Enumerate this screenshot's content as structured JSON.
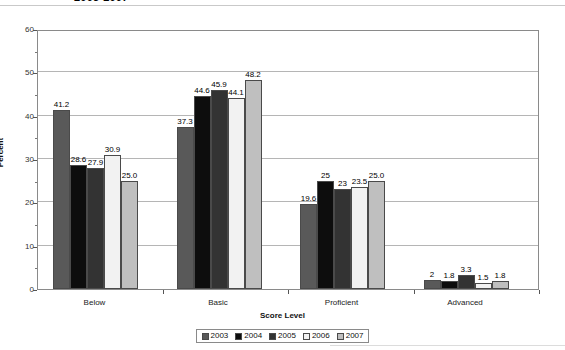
{
  "chart_data": {
    "type": "bar",
    "title": "2003-2007",
    "xlabel": "Score Level",
    "ylabel": "Percent",
    "ylim": [
      0,
      60
    ],
    "ytick_step": 10,
    "yticks": [
      0,
      10,
      20,
      30,
      40,
      50,
      60
    ],
    "grid": true,
    "legend_position": "bottom",
    "categories": [
      "Below",
      "Basic",
      "Proficient",
      "Advanced"
    ],
    "series": [
      {
        "name": "2003",
        "color": "#595959",
        "values": [
          41.2,
          37.3,
          19.6,
          2
        ],
        "labels": [
          "41.2",
          "37.3",
          "19.6",
          "2"
        ]
      },
      {
        "name": "2004",
        "color": "#0d0d0d",
        "values": [
          28.6,
          44.6,
          25,
          1.8
        ],
        "labels": [
          "28.6",
          "44.6",
          "25",
          "1.8"
        ]
      },
      {
        "name": "2005",
        "color": "#333333",
        "values": [
          27.9,
          45.9,
          23,
          3.3
        ],
        "labels": [
          "27.9",
          "45.9",
          "23",
          "3.3"
        ]
      },
      {
        "name": "2006",
        "color": "#f2f2f2",
        "values": [
          30.9,
          44.1,
          23.5,
          1.5
        ],
        "labels": [
          "30.9",
          "44.1",
          "23.5",
          "1.5"
        ]
      },
      {
        "name": "2007",
        "color": "#bfbfbf",
        "values": [
          25.0,
          48.2,
          25.0,
          1.8
        ],
        "labels": [
          "25.0",
          "48.2",
          "25.0",
          "1.8"
        ]
      }
    ]
  },
  "axis": {
    "y_ticks": [
      "60",
      "50",
      "40",
      "30",
      "20",
      "10",
      "0"
    ],
    "y_title": "Percent",
    "x_title": "Score Level",
    "x_categories": [
      "Below",
      "Basic",
      "Proficient",
      "Advanced"
    ]
  },
  "legend": {
    "entries": [
      {
        "label": "2003",
        "color": "#595959"
      },
      {
        "label": "2004",
        "color": "#0d0d0d"
      },
      {
        "label": "2005",
        "color": "#333333"
      },
      {
        "label": "2006",
        "color": "#f2f2f2"
      },
      {
        "label": "2007",
        "color": "#bfbfbf"
      }
    ]
  },
  "header": {
    "title": "2003-2007"
  }
}
